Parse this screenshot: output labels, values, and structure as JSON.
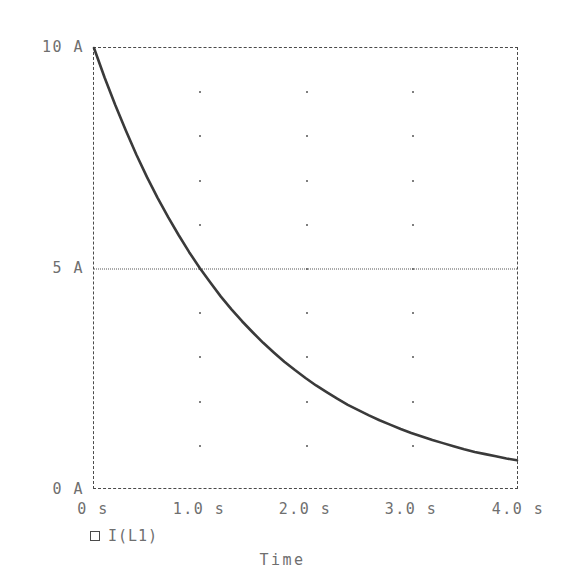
{
  "chart_data": {
    "type": "line",
    "title": "",
    "xlabel": "Time",
    "ylabel": "",
    "xlim": [
      0,
      4.0
    ],
    "ylim": [
      0,
      10
    ],
    "grid": true,
    "legend_position": "below-axis-left",
    "x_unit": "s",
    "y_unit": "A",
    "x_tick_labels": [
      "0 s",
      "1.0 s",
      "2.0 s",
      "3.0 s",
      "4.0 s"
    ],
    "x_tick_values": [
      0,
      1.0,
      2.0,
      3.0,
      4.0
    ],
    "y_tick_labels": [
      "0 A",
      "5 A",
      "10 A"
    ],
    "y_tick_values": [
      0,
      5,
      10
    ],
    "y_minor_gridline_values": [
      1,
      2,
      3,
      4,
      6,
      7,
      8,
      9
    ],
    "x_minor_gridline_values": [
      1.0,
      2.0,
      3.0
    ],
    "series": [
      {
        "name": "I(L1)",
        "marker": "open-square",
        "color": "#3a3a3a",
        "x": [
          0.0,
          0.1,
          0.2,
          0.3,
          0.4,
          0.5,
          0.6,
          0.7,
          0.8,
          0.9,
          1.0,
          1.1,
          1.2,
          1.3,
          1.4,
          1.5,
          1.6,
          1.7,
          1.8,
          1.9,
          2.0,
          2.1,
          2.2,
          2.3,
          2.4,
          2.5,
          2.6,
          2.7,
          2.8,
          2.9,
          3.0,
          3.1,
          3.2,
          3.3,
          3.4,
          3.5,
          3.6,
          3.7,
          3.8,
          3.9,
          4.0
        ],
        "values": [
          10.0,
          9.33,
          8.71,
          8.13,
          7.58,
          7.07,
          6.6,
          6.16,
          5.75,
          5.36,
          5.0,
          4.67,
          4.35,
          4.06,
          3.79,
          3.54,
          3.3,
          3.08,
          2.87,
          2.68,
          2.5,
          2.33,
          2.18,
          2.03,
          1.89,
          1.77,
          1.65,
          1.54,
          1.44,
          1.34,
          1.25,
          1.17,
          1.09,
          1.02,
          0.95,
          0.88,
          0.82,
          0.77,
          0.72,
          0.67,
          0.63
        ]
      }
    ]
  },
  "legend": {
    "entries": [
      {
        "marker": "open-square",
        "label": "I(L1)"
      }
    ]
  },
  "axis_title": {
    "x": "Time"
  }
}
